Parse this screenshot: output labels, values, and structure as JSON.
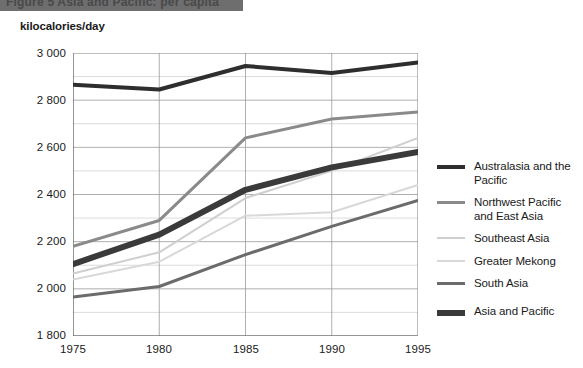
{
  "title_bar": {
    "text": "Figure 5  Asia and Pacific: per capita"
  },
  "axis": {
    "y_caption": "kilocalories/day",
    "y_ticks": [
      "3 000",
      "2 800",
      "2 600",
      "2 400",
      "2 200",
      "2 000",
      "1 800"
    ],
    "x_ticks": [
      "1975",
      "1980",
      "1985",
      "1990",
      "1995"
    ]
  },
  "legend": {
    "items": [
      {
        "label": "Australasia and the Pacific",
        "color": "#2e2e2e",
        "thickness": 4
      },
      {
        "label": "Northwest Pacific and East Asia",
        "color": "#8a8a8a",
        "thickness": 3
      },
      {
        "label": "Southeast Asia",
        "color": "#cfcfcf",
        "thickness": 2
      },
      {
        "label": "Greater Mekong",
        "color": "#d8d8d8",
        "thickness": 2
      },
      {
        "label": "South Asia",
        "color": "#6b6b6b",
        "thickness": 3
      }
    ],
    "total_item": {
      "label": "Asia and Pacific",
      "color": "#3a3a3a",
      "thickness": 6
    }
  },
  "chart_data": {
    "type": "line",
    "title": "Asia and Pacific: per capita",
    "xlabel": "",
    "ylabel": "kilocalories/day",
    "x": [
      1975,
      1980,
      1985,
      1990,
      1995
    ],
    "xlim": [
      1975,
      1995
    ],
    "ylim": [
      1800,
      3000
    ],
    "ytick_step": 200,
    "grid": true,
    "minor_gridlines": true,
    "minor_grid_step": 100,
    "legend_position": "right",
    "series": [
      {
        "name": "Australasia and the Pacific",
        "color": "#2e2e2e",
        "thickness": 4,
        "values": [
          2865,
          2845,
          2945,
          2915,
          2960
        ]
      },
      {
        "name": "Northwest Pacific and East Asia",
        "color": "#8a8a8a",
        "thickness": 3,
        "values": [
          2180,
          2290,
          2640,
          2720,
          2750
        ]
      },
      {
        "name": "Southeast Asia",
        "color": "#cfcfcf",
        "thickness": 2,
        "values": [
          2065,
          2155,
          2385,
          2500,
          2640
        ]
      },
      {
        "name": "Greater Mekong",
        "color": "#d8d8d8",
        "thickness": 2,
        "values": [
          2040,
          2115,
          2310,
          2325,
          2440
        ]
      },
      {
        "name": "South Asia",
        "color": "#6b6b6b",
        "thickness": 3,
        "values": [
          1965,
          2010,
          2145,
          2265,
          2375
        ]
      },
      {
        "name": "Asia and Pacific",
        "color": "#3a3a3a",
        "thickness": 6,
        "values": [
          2105,
          2230,
          2420,
          2515,
          2580
        ]
      }
    ]
  }
}
